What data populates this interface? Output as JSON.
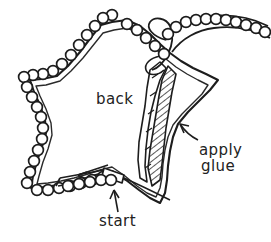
{
  "diagram": {
    "kind": "hand-drawn craft instruction sketch",
    "background_color": "#ffffff",
    "ink_color": "#222222"
  },
  "labels": {
    "back": "back",
    "apply": "apply",
    "glue": "glue",
    "start": "start"
  },
  "annotations": {
    "glue_arrow": "curved arrow pointing from apply glue text up-left to hatched glue strip",
    "start_arrow": "upward arrow pointing from start text to the trim start tab",
    "direction_arrow": "leftward arrow showing direction of trim application"
  },
  "elements": {
    "star": "five-pointed star with double outline, back side facing up",
    "beaded_trim": "scalloped row of small circles following the star outline",
    "trim_tail": "loose length of beaded trim curving off to the upper right",
    "glue_strip": "diagonally hatched band along the right inner edge",
    "start_tab": "short trim tab at the lower edge marking the starting point"
  }
}
